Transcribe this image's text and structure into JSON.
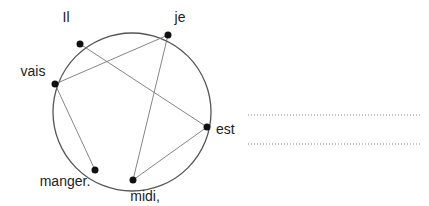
{
  "diagram": {
    "words": [
      {
        "id": "il",
        "label": "Il"
      },
      {
        "id": "je",
        "label": "je"
      },
      {
        "id": "vais",
        "label": "vais"
      },
      {
        "id": "est",
        "label": "est"
      },
      {
        "id": "midi",
        "label": "midi,"
      },
      {
        "id": "manger",
        "label": "manger."
      }
    ],
    "connections": [
      [
        "il",
        "est"
      ],
      [
        "est",
        "midi"
      ],
      [
        "midi",
        "je"
      ],
      [
        "je",
        "vais"
      ],
      [
        "vais",
        "manger"
      ]
    ],
    "answer_lines": [
      {
        "value": ""
      },
      {
        "value": ""
      }
    ],
    "colors": {
      "circle": "#555555",
      "line": "#777777",
      "dot": "#111111",
      "text": "#222222"
    }
  }
}
